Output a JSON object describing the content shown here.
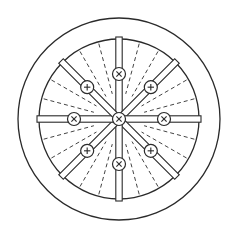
{
  "diagram": {
    "title": "",
    "center": [
      119,
      119
    ],
    "outer_ring_radius": 101,
    "inner_ring_radius": 80,
    "spoke_count": 8,
    "spoke_half_width": 3.2,
    "dashed_lines_per_sector": 2,
    "colors": {
      "stroke": "#2a2a2a",
      "background": "#ffffff"
    },
    "nodes": [
      {
        "id": "center",
        "position": "center",
        "symbol": "x"
      },
      {
        "id": "top",
        "position": "top",
        "symbol": "x"
      },
      {
        "id": "top-right",
        "position": "top-right",
        "symbol": "+"
      },
      {
        "id": "right",
        "position": "right",
        "symbol": "x"
      },
      {
        "id": "bottom-right",
        "position": "bottom-right",
        "symbol": "+"
      },
      {
        "id": "bottom",
        "position": "bottom",
        "symbol": "x"
      },
      {
        "id": "bottom-left",
        "position": "bottom-left",
        "symbol": "+"
      },
      {
        "id": "left",
        "position": "left",
        "symbol": "x"
      },
      {
        "id": "top-left",
        "position": "top-left",
        "symbol": "+"
      }
    ],
    "node_radius_from_center": 45,
    "node_circle_radius": 6.5
  }
}
